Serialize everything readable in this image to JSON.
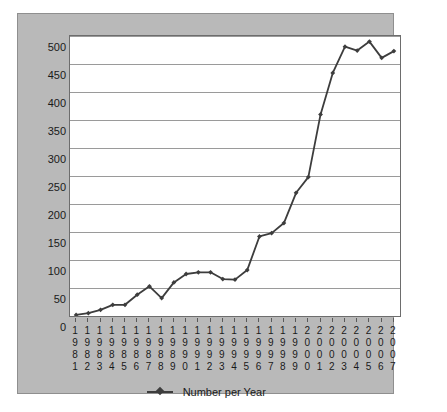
{
  "chart_data": {
    "type": "line",
    "title": "",
    "xlabel": "",
    "ylabel": "",
    "ylim": [
      0,
      500
    ],
    "ytick_step": 50,
    "yticks": [
      500,
      450,
      400,
      350,
      300,
      250,
      200,
      150,
      100,
      50,
      0
    ],
    "grid": true,
    "legend_position": "bottom",
    "legend": [
      "Number per Year"
    ],
    "categories": [
      "1981",
      "1982",
      "1983",
      "1984",
      "1985",
      "1986",
      "1987",
      "1988",
      "1989",
      "1990",
      "1991",
      "1992",
      "1993",
      "1994",
      "1995",
      "1996",
      "1997",
      "1998",
      "1999",
      "2000",
      "2001",
      "2002",
      "2003",
      "2004",
      "2005",
      "2006",
      "2007"
    ],
    "series": [
      {
        "name": "Number per Year",
        "color": "#3d3d3d",
        "marker": "diamond",
        "values": [
          2,
          5,
          11,
          20,
          20,
          38,
          53,
          32,
          60,
          75,
          78,
          78,
          66,
          65,
          82,
          142,
          148,
          166,
          220,
          248,
          360,
          434,
          481,
          474,
          490,
          461,
          473
        ]
      }
    ]
  },
  "style": {
    "panel_background": "#b9b9b9",
    "plot_background": "#ffffff",
    "gridline_color": "#9a9a9a",
    "axis_color": "#6d6d6d",
    "text_color": "#1a1a1a",
    "series_color": "#3d3d3d"
  }
}
